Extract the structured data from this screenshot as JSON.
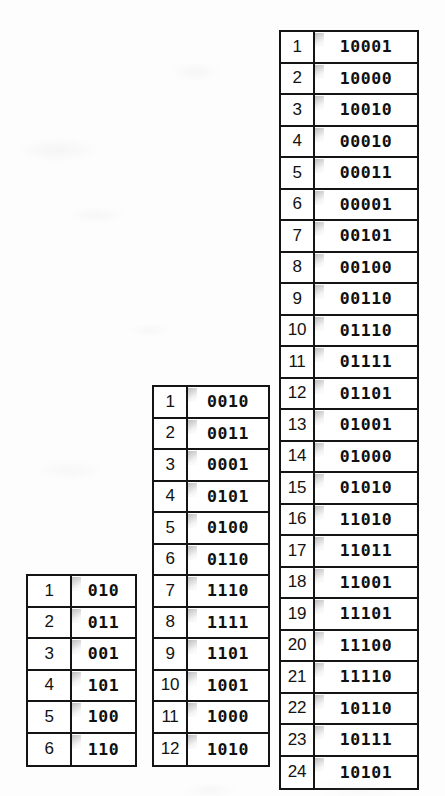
{
  "figure": {
    "type": "gray-code-tables",
    "background_color": "#fdfdfd",
    "ink_color": "#141414",
    "table_count": 3
  },
  "tables": [
    {
      "id": "left",
      "name": "3-bit-code-table",
      "bit_width": 3,
      "row_count": 6,
      "indices": [
        "1",
        "2",
        "3",
        "4",
        "5",
        "6"
      ],
      "codes": [
        "010",
        "011",
        "001",
        "101",
        "100",
        "110"
      ]
    },
    {
      "id": "middle",
      "name": "4-bit-code-table",
      "bit_width": 4,
      "row_count": 12,
      "indices": [
        "1",
        "2",
        "3",
        "4",
        "5",
        "6",
        "7",
        "8",
        "9",
        "10",
        "11",
        "12"
      ],
      "codes": [
        "0010",
        "0011",
        "0001",
        "0101",
        "0100",
        "0110",
        "1110",
        "1111",
        "1101",
        "1001",
        "1000",
        "1010"
      ]
    },
    {
      "id": "right",
      "name": "5-bit-code-table",
      "bit_width": 5,
      "row_count": 24,
      "indices": [
        "1",
        "2",
        "3",
        "4",
        "5",
        "6",
        "7",
        "8",
        "9",
        "10",
        "11",
        "12",
        "13",
        "14",
        "15",
        "16",
        "17",
        "18",
        "19",
        "20",
        "21",
        "22",
        "23",
        "24"
      ],
      "codes": [
        "10001",
        "10000",
        "10010",
        "00010",
        "00011",
        "00001",
        "00101",
        "00100",
        "00110",
        "01110",
        "01111",
        "01101",
        "01001",
        "01000",
        "01010",
        "11010",
        "11011",
        "11001",
        "11101",
        "11100",
        "11110",
        "10110",
        "10111",
        "10101"
      ]
    }
  ]
}
